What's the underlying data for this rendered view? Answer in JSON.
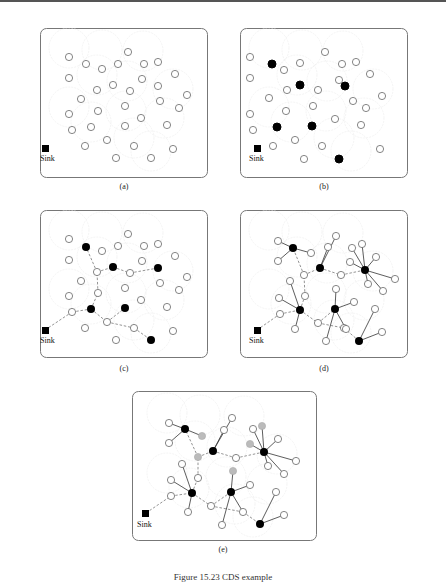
{
  "figure": {
    "caption": "Figure 15.23 CDS example",
    "sink_label": "Sink",
    "colors": {
      "border": "#777777",
      "node_stroke": "#555555",
      "dominator_fill": "#000000",
      "gray_node_fill": "#bbbbbb",
      "range_circle": "#e6e6e6",
      "dashed_link": "#888888",
      "solid_link": "#333333"
    },
    "panels": [
      {
        "id": "a",
        "label": "(a)"
      },
      {
        "id": "b",
        "label": "(b)"
      },
      {
        "id": "c",
        "label": "(c)"
      },
      {
        "id": "d",
        "label": "(d)"
      },
      {
        "id": "e",
        "label": "(e)"
      }
    ],
    "nodes": [
      [
        29,
        20
      ],
      [
        45,
        27
      ],
      [
        62,
        22
      ],
      [
        73,
        14
      ],
      [
        77,
        26
      ],
      [
        88,
        27
      ],
      [
        103,
        23
      ],
      [
        112,
        43
      ],
      [
        29,
        42
      ],
      [
        57,
        47
      ],
      [
        73,
        55
      ],
      [
        87,
        53
      ],
      [
        102,
        47
      ],
      [
        115,
        51
      ],
      [
        133,
        61
      ],
      [
        50,
        64
      ],
      [
        88,
        71
      ],
      [
        107,
        63
      ],
      [
        117,
        65
      ],
      [
        128,
        73
      ],
      [
        29,
        79
      ],
      [
        57,
        76
      ],
      [
        86,
        83
      ],
      [
        103,
        82
      ],
      [
        124,
        90
      ],
      [
        31,
        95
      ],
      [
        51,
        94
      ],
      [
        86,
        92
      ],
      [
        66,
        105
      ],
      [
        94,
        110
      ],
      [
        113,
        114
      ],
      [
        45,
        111
      ],
      [
        75,
        124
      ],
      [
        111,
        123
      ]
    ],
    "dominators_b": [
      5,
      9,
      13,
      22,
      25,
      32
    ],
    "sink": [
      15,
      120
    ]
  }
}
